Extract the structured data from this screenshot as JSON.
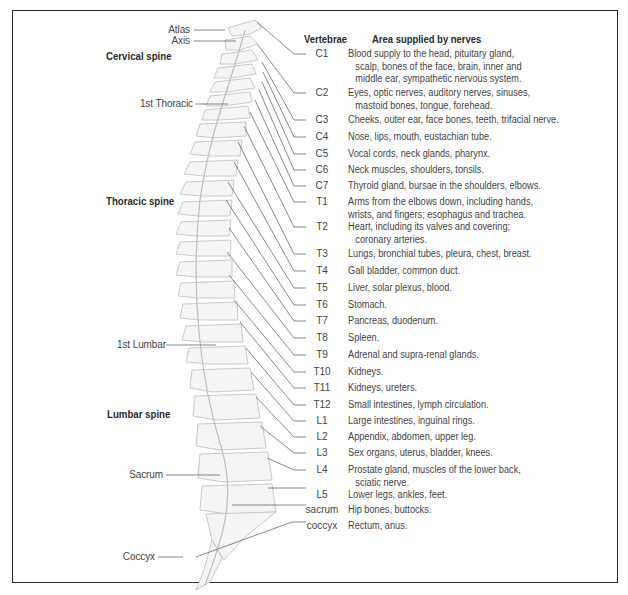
{
  "diagram": {
    "type": "anatomical-spine-chart",
    "headers": {
      "vertebrae": "Vertebrae",
      "area": "Area supplied by nerves"
    },
    "regions": [
      {
        "label": "Cervical spine"
      },
      {
        "label": "Thoracic spine"
      },
      {
        "label": "Lumbar spine"
      }
    ],
    "landmarks": [
      {
        "label": "Atlas"
      },
      {
        "label": "Axis"
      },
      {
        "label": "1st Thoracic"
      },
      {
        "label": "1st Lumbar"
      },
      {
        "label": "Sacrum"
      },
      {
        "label": "Coccyx"
      }
    ],
    "rows": [
      {
        "vertebra": "C1",
        "line1": "Blood supply to the head, pituitary gland,",
        "line2": "scalp, bones of the face, brain, inner and",
        "line3": "middle ear, sympathetic nervous system."
      },
      {
        "vertebra": "C2",
        "line1": "Eyes, optic nerves, auditory nerves, sinuses,",
        "line2": "mastoid bones, tongue, forehead."
      },
      {
        "vertebra": "C3",
        "line1": "Cheeks, outer ear, face bones, teeth, trifacial nerve."
      },
      {
        "vertebra": "C4",
        "line1": "Nose, lips, mouth, eustachian tube."
      },
      {
        "vertebra": "C5",
        "line1": "Vocal cords, neck glands, pharynx."
      },
      {
        "vertebra": "C6",
        "line1": "Neck muscles, shoulders, tonsils."
      },
      {
        "vertebra": "C7",
        "line1": "Thyroid gland, bursae in the shoulders, elbows."
      },
      {
        "vertebra": "T1",
        "line1": "Arms from the elbows down, including hands,",
        "line2": "wrists, and fingers; esophagus and trachea."
      },
      {
        "vertebra": "T2",
        "line1": "Heart, including its valves and covering;",
        "line2": "coronary arteries."
      },
      {
        "vertebra": "T3",
        "line1": "Lungs, bronchial tubes, pleura, chest, breast."
      },
      {
        "vertebra": "T4",
        "line1": "Gall bladder, common duct."
      },
      {
        "vertebra": "T5",
        "line1": "Liver, solar plexus, blood."
      },
      {
        "vertebra": "T6",
        "line1": "Stomach."
      },
      {
        "vertebra": "T7",
        "line1": "Pancreas, duodenum."
      },
      {
        "vertebra": "T8",
        "line1": "Spleen."
      },
      {
        "vertebra": "T9",
        "line1": "Adrenal and supra-renal glands."
      },
      {
        "vertebra": "T10",
        "line1": "Kidneys."
      },
      {
        "vertebra": "T11",
        "line1": "Kidneys, ureters."
      },
      {
        "vertebra": "T12",
        "line1": "Small intestines, lymph circulation."
      },
      {
        "vertebra": "L1",
        "line1": "Large intestines, inguinal rings."
      },
      {
        "vertebra": "L2",
        "line1": "Appendix, abdomen, upper leg."
      },
      {
        "vertebra": "L3",
        "line1": "Sex organs, uterus, bladder, knees."
      },
      {
        "vertebra": "L4",
        "line1": "Prostate gland, muscles of the lower back,",
        "line2": "sciatic nerve."
      },
      {
        "vertebra": "L5",
        "line1": "Lower legs, ankles, feet."
      },
      {
        "vertebra": "sacrum",
        "line1": "Hip bones, buttocks."
      },
      {
        "vertebra": "coccyx",
        "line1": "Rectum, anus."
      }
    ],
    "colors": {
      "frame": "#2a2a2a",
      "bone_fill": "#f4f4f4",
      "bone_stroke": "#c8c8c8",
      "disc": "#b8b8b8",
      "leader": "#555555",
      "text": "#444444"
    }
  }
}
